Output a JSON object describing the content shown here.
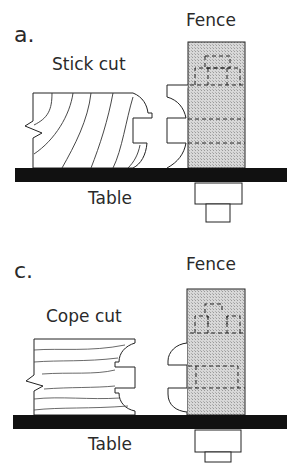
{
  "diagram": {
    "panels": [
      {
        "id": "a",
        "letter": "a.",
        "cut_label": "Stick cut",
        "fence_label": "Fence",
        "table_label": "Table"
      },
      {
        "id": "c",
        "letter": "c.",
        "cut_label": "Cope cut",
        "fence_label": "Fence",
        "table_label": "Table"
      }
    ],
    "colors": {
      "line": "#1a1a1a",
      "fence_fill": "#cfcfcf",
      "table_fill": "#111111",
      "background": "#ffffff"
    }
  }
}
